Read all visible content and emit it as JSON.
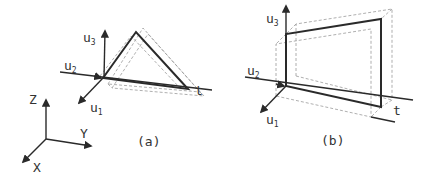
{
  "figure": {
    "panel_a": {
      "caption": "(a)",
      "axis_labels": {
        "u1": "u",
        "u1_sub": "1",
        "u2": "u",
        "u2_sub": "2",
        "u3": "u",
        "u3_sub": "3",
        "t": "t"
      },
      "shape": "triangle"
    },
    "panel_b": {
      "caption": "(b)",
      "axis_labels": {
        "u1": "u",
        "u1_sub": "1",
        "u2": "u",
        "u2_sub": "2",
        "u3": "u",
        "u3_sub": "3",
        "t": "t"
      },
      "shape": "trapezoid"
    },
    "world_frame": {
      "x": "X",
      "y": "Y",
      "z": "Z"
    },
    "colors": {
      "line": "#2a2a2a",
      "dashed": "#9a9a9a",
      "text": "#333333",
      "background": "#ffffff"
    }
  }
}
